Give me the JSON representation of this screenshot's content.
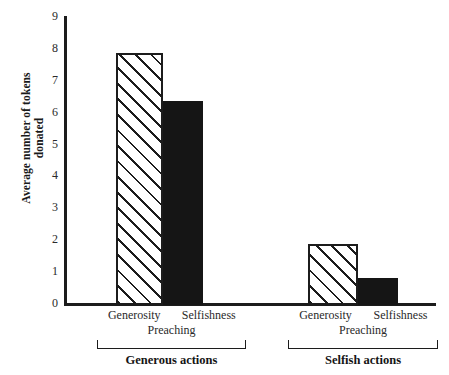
{
  "chart_data": {
    "type": "bar",
    "title": "",
    "subtitle": "",
    "xlabel": "",
    "ylabel": "Average number of\ntokens donated",
    "ylim": [
      0,
      9
    ],
    "ytick_labels": [
      "9",
      "8",
      "7",
      "6",
      "5",
      "4",
      "3",
      "2",
      "1",
      "0"
    ],
    "yticks": [
      9,
      8,
      7,
      6,
      5,
      4,
      3,
      2,
      1,
      0
    ],
    "grid": false,
    "legend": "none",
    "categories": [
      "Generous actions",
      "Selfish actions"
    ],
    "sub_axis_label": "Preaching",
    "series": [
      {
        "name": "Generosity",
        "style": "hatched",
        "values": [
          7.9,
          1.9
        ]
      },
      {
        "name": "Selfishness",
        "style": "solid",
        "values": [
          6.4,
          0.85
        ]
      }
    ],
    "groups": [
      {
        "group_label": "Generous actions",
        "sub_label": "Preaching",
        "bars": [
          {
            "label": "Generosity",
            "value": 7.9,
            "style": "hatched"
          },
          {
            "label": "Selfishness",
            "value": 6.4,
            "style": "solid"
          }
        ]
      },
      {
        "group_label": "Selfish actions",
        "sub_label": "Preaching",
        "bars": [
          {
            "label": "Generosity",
            "value": 1.9,
            "style": "hatched"
          },
          {
            "label": "Selfishness",
            "value": 0.85,
            "style": "solid"
          }
        ]
      }
    ],
    "colors": {
      "axis": "#1c1c1c",
      "solid_bar": "#151515",
      "hatched_bar_fill": "#ffffff",
      "hatched_bar_line": "#1c1c1c",
      "background": "#ffffff",
      "text": "#2a2a2a"
    }
  }
}
